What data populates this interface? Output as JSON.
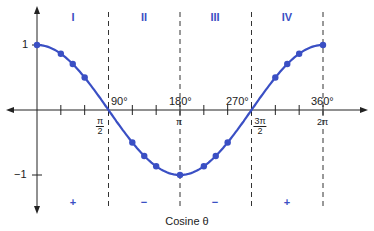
{
  "title": "Cosine θ",
  "colors": {
    "curve": "#3a4fc4",
    "axis": "#222222",
    "dashed": "#333333"
  },
  "y_labels": {
    "pos": "1",
    "neg": "−1"
  },
  "degree_labels": [
    "90°",
    "180°",
    "270°",
    "360°"
  ],
  "radian_labels": [
    {
      "num": "π",
      "den": "2"
    },
    {
      "single": "π"
    },
    {
      "num": "3π",
      "den": "2"
    },
    {
      "single": "2π"
    }
  ],
  "quadrants": [
    "I",
    "II",
    "III",
    "IV"
  ],
  "signs": [
    "+",
    "−",
    "−",
    "+"
  ],
  "chart_data": {
    "type": "line",
    "title": "Cosine θ",
    "xlabel": "θ",
    "ylabel": "cos θ",
    "x_ticks_deg": [
      90,
      180,
      270,
      360
    ],
    "x_ticks_rad": [
      "π/2",
      "π",
      "3π/2",
      "2π"
    ],
    "ylim": [
      -1,
      1
    ],
    "quadrant_labels": [
      "I",
      "II",
      "III",
      "IV"
    ],
    "quadrant_signs": [
      "+",
      "−",
      "−",
      "+"
    ],
    "points_deg": [
      0,
      30,
      45,
      60,
      120,
      135,
      150,
      180,
      210,
      225,
      240,
      300,
      315,
      330,
      360
    ],
    "points_val": [
      1,
      0.866,
      0.707,
      0.5,
      -0.5,
      -0.707,
      -0.866,
      -1,
      -0.866,
      -0.707,
      -0.5,
      0.5,
      0.707,
      0.866,
      1
    ]
  }
}
